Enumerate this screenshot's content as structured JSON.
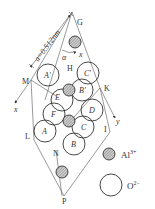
{
  "figure": {
    "lattice_dimension_label": "a=0.512nm",
    "angle_label": "α",
    "axis_labels": {
      "x": "x",
      "y": "y"
    },
    "vertex_labels": [
      "G",
      "H",
      "K",
      "I",
      "M",
      "L",
      "N",
      "P"
    ],
    "oxygen_labels": {
      "A_prime": "A′",
      "B_prime": "B′",
      "C_prime": "C′",
      "A": "A",
      "B": "B",
      "C": "C",
      "D": "D",
      "E": "E",
      "F": "F"
    }
  },
  "legend": {
    "items": [
      {
        "name": "aluminum",
        "label": "Al",
        "charge": "3+",
        "symbol": "hatched-circle"
      },
      {
        "name": "oxygen",
        "label": "O",
        "charge": "2−",
        "symbol": "open-circle"
      }
    ]
  },
  "colors": {
    "stroke": "#333333",
    "hatch": "#777777",
    "background": "#ffffff"
  }
}
